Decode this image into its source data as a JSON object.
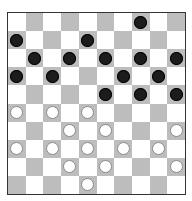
{
  "game": "draughts",
  "board": {
    "size": 10,
    "colors": {
      "light": "#ffffff",
      "dark": "#bdbdbd",
      "black_piece": "#1c1c1c",
      "white_piece": "#ffffff"
    },
    "rows": [
      [
        "",
        "",
        "",
        "",
        "",
        "",
        "",
        "b",
        "",
        ""
      ],
      [
        "b",
        "",
        "",
        "",
        "b",
        "",
        "",
        "",
        "",
        ""
      ],
      [
        "",
        "b",
        "",
        "b",
        "",
        "b",
        "",
        "b",
        "",
        "b"
      ],
      [
        "b",
        "",
        "b",
        "",
        "",
        "",
        "b",
        "",
        "b",
        ""
      ],
      [
        "",
        "",
        "",
        "",
        "",
        "b",
        "",
        "b",
        "",
        "b"
      ],
      [
        "w",
        "",
        "w",
        "",
        "w",
        "",
        "",
        "",
        "",
        ""
      ],
      [
        "",
        "",
        "",
        "w",
        "",
        "w",
        "",
        "",
        "",
        "w"
      ],
      [
        "w",
        "",
        "w",
        "",
        "w",
        "",
        "w",
        "",
        "w",
        ""
      ],
      [
        "",
        "",
        "",
        "w",
        "",
        "w",
        "",
        "",
        "",
        "w"
      ],
      [
        "",
        "",
        "",
        "",
        "w",
        "",
        "",
        "",
        "",
        ""
      ]
    ]
  }
}
